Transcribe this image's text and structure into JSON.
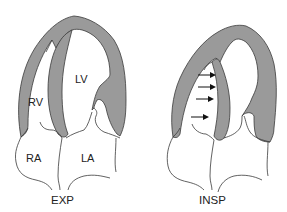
{
  "figure": {
    "panels": [
      {
        "id": "expiration",
        "caption": "EXP",
        "labels": {
          "right_ventricle": "RV",
          "left_ventricle": "LV",
          "right_atrium": "RA",
          "left_atrium": "LA"
        }
      },
      {
        "id": "inspiration",
        "caption": "INSP",
        "arrows": 4,
        "arrow_direction": "right (septal shift toward LV)"
      }
    ],
    "colors": {
      "myocardium": "#9a9a9a",
      "outline": "#3a3a3a",
      "background": "#ffffff",
      "arrow": "#111111"
    }
  }
}
